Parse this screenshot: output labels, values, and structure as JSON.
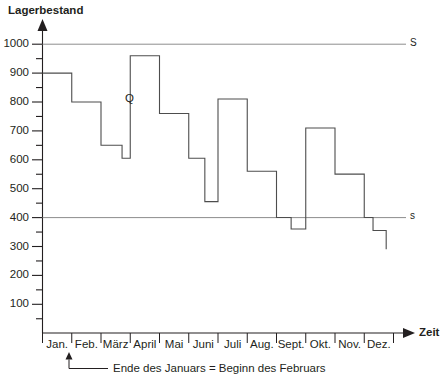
{
  "chart_data": {
    "type": "line",
    "title": "",
    "ylabel": "Lagerbestand",
    "xlabel": "Zeit",
    "ylim": [
      0,
      1000
    ],
    "xlim": [
      0,
      12
    ],
    "grid": false,
    "legend_position": "none",
    "y_ticks": [
      100,
      200,
      300,
      400,
      500,
      600,
      700,
      800,
      900,
      1000
    ],
    "y_tick_labels": [
      "100",
      "200",
      "300",
      "400",
      "500",
      "600",
      "700",
      "800",
      "900",
      "1000"
    ],
    "y_minor_ticks": [
      50,
      150,
      250,
      350,
      450,
      550,
      650,
      750,
      850,
      950
    ],
    "categories": [
      "Jan.",
      "Feb.",
      "März",
      "April",
      "Mai",
      "Juni",
      "Juli",
      "Aug.",
      "Sept.",
      "Okt.",
      "Nov.",
      "Dez."
    ],
    "series": [
      {
        "name": "Lagerbestand",
        "label": "Q",
        "step_type": "post",
        "segments": [
          {
            "month": "Jan.",
            "start": 0,
            "end": 1,
            "value": 900
          },
          {
            "month": "Feb.",
            "start": 1,
            "end": 2,
            "value": 800
          },
          {
            "month": "März",
            "start": 2,
            "end": 2.72,
            "value": 650
          },
          {
            "month": "März",
            "start": 2.72,
            "end": 3,
            "value": 605
          },
          {
            "month": "April",
            "start": 3,
            "end": 4,
            "value": 960
          },
          {
            "month": "Mai",
            "start": 4,
            "end": 5,
            "value": 760
          },
          {
            "month": "Juni",
            "start": 5,
            "end": 5.55,
            "value": 605
          },
          {
            "month": "Juni",
            "start": 5.55,
            "end": 6,
            "value": 455
          },
          {
            "month": "Juli",
            "start": 6,
            "end": 7,
            "value": 810
          },
          {
            "month": "Aug.",
            "start": 7,
            "end": 8,
            "value": 560
          },
          {
            "month": "Sept.",
            "start": 8,
            "end": 8.5,
            "value": 400
          },
          {
            "month": "Sept.",
            "start": 8.5,
            "end": 9,
            "value": 360
          },
          {
            "month": "Okt.",
            "start": 9,
            "end": 10,
            "value": 710
          },
          {
            "month": "Nov.",
            "start": 10,
            "end": 11,
            "value": 550
          },
          {
            "month": "Dez.",
            "start": 11,
            "end": 11.3,
            "value": 400
          },
          {
            "month": "Dez.",
            "start": 11.3,
            "end": 11.75,
            "value": 355
          },
          {
            "month": "Dez.",
            "start": 11.75,
            "end": 11.75,
            "value": 290
          }
        ]
      }
    ],
    "reference_lines": [
      {
        "label": "S",
        "value": 1000,
        "description": "upper reference level"
      },
      {
        "label": "s",
        "value": 400,
        "description": "lower reference level"
      }
    ],
    "annotations": [
      {
        "text": "Ende des Januars = Beginn des Februars",
        "points_to": "Feb."
      },
      {
        "text": "Q",
        "description": "series marker"
      }
    ]
  },
  "colors": {
    "axis": "#231f20",
    "series": "#4d4d4d",
    "reference": "#8d8d8d",
    "background": "#ffffff"
  }
}
